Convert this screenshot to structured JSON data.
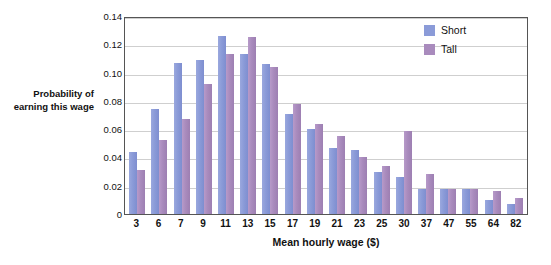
{
  "chart_data": {
    "type": "bar",
    "title": "",
    "xlabel": "Mean hourly wage ($)",
    "ylabel": "Probability of earning this wage",
    "ylim": [
      0,
      0.14
    ],
    "yticks": [
      0,
      0.02,
      0.04,
      0.06,
      0.08,
      0.1,
      0.12,
      0.14
    ],
    "ytick_labels": [
      "0",
      "0.02",
      "0.04",
      "0.06",
      "0.08",
      "0.10",
      "0.12",
      "0.14"
    ],
    "grid": true,
    "legend_position": "top-right",
    "categories": [
      "3",
      "6",
      "7",
      "9",
      "11",
      "13",
      "15",
      "17",
      "19",
      "21",
      "23",
      "25",
      "30",
      "37",
      "47",
      "55",
      "64",
      "82"
    ],
    "series": [
      {
        "name": "Short",
        "color": "#8b9bd8",
        "values": [
          0.044,
          0.074,
          0.107,
          0.109,
          0.126,
          0.113,
          0.106,
          0.071,
          0.06,
          0.047,
          0.045,
          0.03,
          0.026,
          0.018,
          0.018,
          0.018,
          0.01,
          0.007
        ]
      },
      {
        "name": "Tall",
        "color": "#a98bbd",
        "values": [
          0.031,
          0.052,
          0.067,
          0.092,
          0.113,
          0.125,
          0.104,
          0.078,
          0.064,
          0.055,
          0.04,
          0.034,
          0.059,
          0.028,
          0.018,
          0.018,
          0.016,
          0.011
        ]
      }
    ]
  }
}
